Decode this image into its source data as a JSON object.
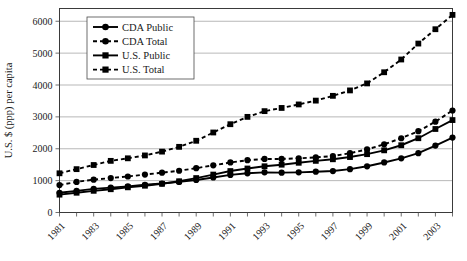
{
  "chart_data": {
    "type": "line",
    "title": "",
    "xlabel": "",
    "ylabel": "U.S. $ (ppp) per capita",
    "xlim": [
      1981,
      2004
    ],
    "ylim": [
      0,
      6400
    ],
    "yticks": [
      0,
      1000,
      2000,
      3000,
      4000,
      5000,
      6000
    ],
    "ytick_labels": [
      "0",
      "1000",
      "2000",
      "3000",
      "4000",
      "5000",
      "6000"
    ],
    "grid": "horizontal",
    "legend_position": "top-left-inside",
    "x": [
      1981,
      1982,
      1983,
      1984,
      1985,
      1986,
      1987,
      1988,
      1989,
      1990,
      1991,
      1992,
      1993,
      1994,
      1995,
      1996,
      1997,
      1998,
      1999,
      2000,
      2001,
      2002,
      2003,
      2004
    ],
    "xtick_labels": [
      "1981",
      "1983",
      "1985",
      "1987",
      "1989",
      "1991",
      "1993",
      "1995",
      "1997",
      "1999",
      "2001",
      "2003"
    ],
    "xtick_values": [
      1981,
      1983,
      1985,
      1987,
      1989,
      1991,
      1993,
      1995,
      1997,
      1999,
      2001,
      2003
    ],
    "series": [
      {
        "name": "CDA Public",
        "marker": "circle",
        "dash": "solid",
        "color": "#000000",
        "values": [
          620,
          680,
          740,
          780,
          820,
          870,
          910,
          960,
          1020,
          1100,
          1180,
          1230,
          1260,
          1250,
          1260,
          1280,
          1300,
          1360,
          1450,
          1570,
          1700,
          1860,
          2100,
          2350
        ]
      },
      {
        "name": "CDA Total",
        "marker": "circle",
        "dash": "dashed",
        "color": "#000000",
        "values": [
          860,
          960,
          1030,
          1080,
          1130,
          1190,
          1250,
          1310,
          1390,
          1480,
          1570,
          1640,
          1680,
          1680,
          1700,
          1730,
          1770,
          1860,
          1980,
          2140,
          2330,
          2550,
          2850,
          3200
        ]
      },
      {
        "name": "U.S. Public",
        "marker": "square",
        "dash": "solid",
        "color": "#000000",
        "values": [
          560,
          620,
          680,
          730,
          790,
          840,
          900,
          980,
          1080,
          1190,
          1300,
          1380,
          1450,
          1500,
          1560,
          1620,
          1670,
          1740,
          1830,
          1950,
          2110,
          2330,
          2620,
          2900
        ]
      },
      {
        "name": "U.S. Total",
        "marker": "square",
        "dash": "dashed",
        "color": "#000000",
        "values": [
          1230,
          1360,
          1490,
          1620,
          1700,
          1790,
          1910,
          2060,
          2250,
          2510,
          2770,
          3000,
          3180,
          3280,
          3390,
          3510,
          3660,
          3830,
          4050,
          4400,
          4800,
          5300,
          5750,
          6200
        ]
      }
    ]
  },
  "legend": {
    "entries": [
      {
        "label": "CDA Public"
      },
      {
        "label": "CDA Total"
      },
      {
        "label": "U.S. Public"
      },
      {
        "label": "U.S. Total"
      }
    ]
  },
  "axes": {
    "y_title": "U.S. $ (ppp) per capita"
  }
}
